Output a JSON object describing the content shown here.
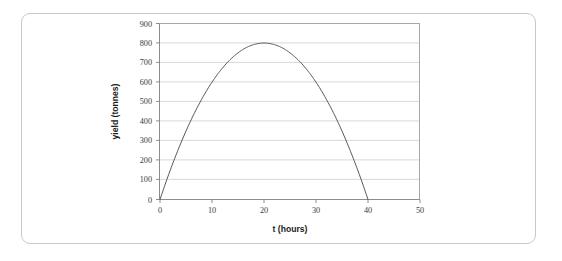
{
  "figure": {
    "frame_color": "#c9c9c9",
    "background": "#ffffff"
  },
  "chart_data": {
    "type": "line",
    "title": "",
    "subtitle": "",
    "xlabel": "t (hours)",
    "ylabel": "yield (tonnes)",
    "xlim": [
      0,
      50
    ],
    "ylim": [
      0,
      900
    ],
    "xticks": [
      0,
      10,
      20,
      30,
      40,
      50
    ],
    "yticks": [
      0,
      100,
      200,
      300,
      400,
      500,
      600,
      700,
      800,
      900
    ],
    "xtick_labels": [
      "0",
      "10",
      "20",
      "30",
      "40",
      "50"
    ],
    "ytick_labels": [
      "0",
      "100",
      "200",
      "300",
      "400",
      "500",
      "600",
      "700",
      "800",
      "900"
    ],
    "grid": {
      "horizontal": true,
      "vertical": false,
      "color": "#d8d8d8"
    },
    "legend": {
      "visible": false,
      "position": "none"
    },
    "annotations": [],
    "series": [
      {
        "name": "yield",
        "color": "#555555",
        "line_width": 1,
        "equation": "y = 2t(40 - t)",
        "vertex": {
          "t": 20,
          "yield": 800
        },
        "roots": [
          0,
          40
        ],
        "x": [
          0,
          1,
          2,
          3,
          4,
          5,
          6,
          7,
          8,
          9,
          10,
          11,
          12,
          13,
          14,
          15,
          16,
          17,
          18,
          19,
          20,
          21,
          22,
          23,
          24,
          25,
          26,
          27,
          28,
          29,
          30,
          31,
          32,
          33,
          34,
          35,
          36,
          37,
          38,
          39,
          40
        ],
        "values": [
          0,
          78,
          152,
          222,
          288,
          350,
          408,
          462,
          512,
          558,
          600,
          638,
          672,
          702,
          728,
          750,
          768,
          782,
          792,
          798,
          800,
          798,
          792,
          782,
          768,
          750,
          728,
          702,
          672,
          638,
          600,
          558,
          512,
          462,
          408,
          350,
          288,
          222,
          152,
          78,
          0
        ]
      }
    ]
  }
}
